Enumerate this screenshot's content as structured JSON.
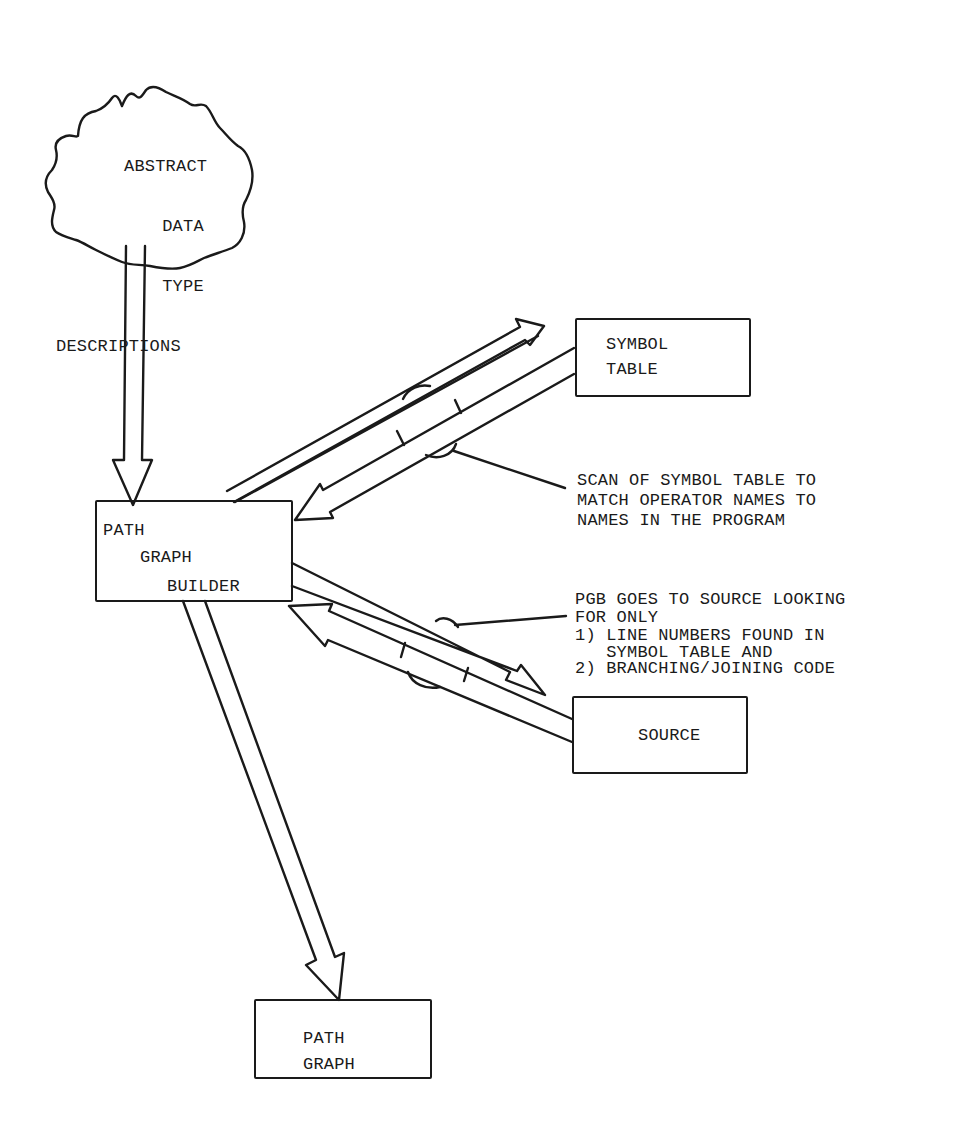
{
  "diagram": {
    "nodes": {
      "adt": {
        "shape": "cloud",
        "lines": [
          "ABSTRACT",
          "DATA",
          "TYPE",
          "DESCRIPTIONS"
        ]
      },
      "pgb": {
        "shape": "box",
        "lines": [
          "PATH",
          "GRAPH",
          "BUILDER"
        ]
      },
      "symtab": {
        "shape": "box",
        "lines": [
          "SYMBOL",
          "TABLE"
        ]
      },
      "source": {
        "shape": "box",
        "lines": [
          "SOURCE"
        ]
      },
      "pathgraph": {
        "shape": "box",
        "lines": [
          "PATH",
          "GRAPH"
        ]
      }
    },
    "edges": [
      {
        "from": "adt",
        "to": "pgb",
        "style": "hollow-arrow"
      },
      {
        "from": "pgb",
        "to": "symtab",
        "style": "hollow-arrow"
      },
      {
        "from": "symtab",
        "to": "pgb",
        "style": "hollow-arrow"
      },
      {
        "from": "pgb",
        "to": "source",
        "style": "hollow-arrow"
      },
      {
        "from": "source",
        "to": "pgb",
        "style": "hollow-arrow"
      },
      {
        "from": "pgb",
        "to": "pathgraph",
        "style": "hollow-arrow"
      }
    ],
    "annotations": {
      "symtab_scan": {
        "lines": [
          "SCAN OF SYMBOL TABLE TO",
          "MATCH OPERATOR NAMES TO",
          "NAMES IN THE PROGRAM"
        ]
      },
      "source_scan": {
        "lines": [
          "PGB GOES TO SOURCE LOOKING",
          "FOR ONLY",
          "1) LINE NUMBERS FOUND IN",
          "   SYMBOL TABLE AND",
          "2) BRANCHING/JOINING CODE"
        ]
      }
    },
    "colors": {
      "ink": "#1a1a1a",
      "paper": "#ffffff"
    }
  }
}
